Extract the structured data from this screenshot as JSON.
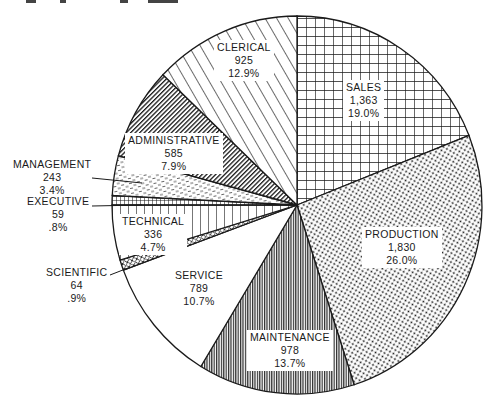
{
  "chart_data": {
    "type": "pie",
    "title": "",
    "start_angle_deg": 0,
    "direction": "clockwise",
    "center": [
      297,
      205
    ],
    "radius": [
      185,
      189
    ],
    "slices": [
      {
        "key": "sales",
        "name": "SALES",
        "value": 1363,
        "value_label": "1,363",
        "percent": 19.0,
        "percent_label": "19.0%",
        "pattern": "grid"
      },
      {
        "key": "production",
        "name": "PRODUCTION",
        "value": 1830,
        "value_label": "1,830",
        "percent": 26.0,
        "percent_label": "26.0%",
        "pattern": "dots"
      },
      {
        "key": "maintenance",
        "name": "MAINTENANCE",
        "value": 978,
        "value_label": "978",
        "percent": 13.7,
        "percent_label": "13.7%",
        "pattern": "fine-vertical"
      },
      {
        "key": "service",
        "name": "SERVICE",
        "value": 789,
        "value_label": "789",
        "percent": 10.7,
        "percent_label": "10.7%",
        "pattern": "blank"
      },
      {
        "key": "scientific",
        "name": "SCIENTIFIC",
        "value": 64,
        "value_label": "64",
        "percent": 0.9,
        "percent_label": ".9%",
        "pattern": "crosshatch"
      },
      {
        "key": "technical",
        "name": "TECHNICAL",
        "value": 336,
        "value_label": "336",
        "percent": 4.7,
        "percent_label": "4.7%",
        "pattern": "vertical"
      },
      {
        "key": "executive",
        "name": "EXECUTIVE",
        "value": 59,
        "value_label": "59",
        "percent": 0.8,
        "percent_label": ".8%",
        "pattern": "grid-dense"
      },
      {
        "key": "management",
        "name": "MANAGEMENT",
        "value": 243,
        "value_label": "243",
        "percent": 3.4,
        "percent_label": "3.4%",
        "pattern": "dashes"
      },
      {
        "key": "administrative",
        "name": "ADMINISTRATIVE",
        "value": 585,
        "value_label": "585",
        "percent": 7.9,
        "percent_label": "7.9%",
        "pattern": "dense-diagonal"
      },
      {
        "key": "clerical",
        "name": "CLERICAL",
        "value": 925,
        "value_label": "925",
        "percent": 12.9,
        "percent_label": "12.9%",
        "pattern": "diagonal"
      }
    ],
    "total_percent": 100.0,
    "legend": "none (direct labels)"
  },
  "labels": {
    "sales": {
      "name": "SALES",
      "value": "1,363",
      "percent": "19.0%"
    },
    "production": {
      "name": "PRODUCTION",
      "value": "1,830",
      "percent": "26.0%"
    },
    "maintenance": {
      "name": "MAINTENANCE",
      "value": "978",
      "percent": "13.7%"
    },
    "service": {
      "name": "SERVICE",
      "value": "789",
      "percent": "10.7%"
    },
    "scientific": {
      "name": "SCIENTIFIC",
      "value": "64",
      "percent": ".9%"
    },
    "technical": {
      "name": "TECHNICAL",
      "value": "336",
      "percent": "4.7%"
    },
    "executive": {
      "name": "EXECUTIVE",
      "value": "59",
      "percent": ".8%"
    },
    "management": {
      "name": "MANAGEMENT",
      "value": "243",
      "percent": "3.4%"
    },
    "administrative": {
      "name": "ADMINISTRATIVE",
      "value": "585",
      "percent": "7.9%"
    },
    "clerical": {
      "name": "CLERICAL",
      "value": "925",
      "percent": "12.9%"
    }
  },
  "colors": {
    "ink": "#1a1a1a",
    "background": "#ffffff"
  }
}
